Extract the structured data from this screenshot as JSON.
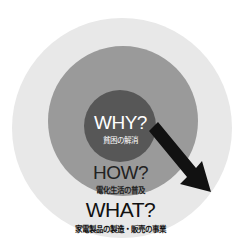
{
  "diagram": {
    "rings": [
      {
        "id": "why",
        "title": "WHY?",
        "subtitle": "貧困の解消",
        "color": "#575757"
      },
      {
        "id": "how",
        "title": "HOW?",
        "subtitle": "電化生活の普及",
        "color": "#9a9a9a"
      },
      {
        "id": "what",
        "title": "WHAT?",
        "subtitle": "家電製品の製造・販売の事業",
        "color": "#e8e8e8"
      }
    ],
    "arrow": {
      "direction": "center-to-lower-right",
      "color": "#111111"
    }
  }
}
